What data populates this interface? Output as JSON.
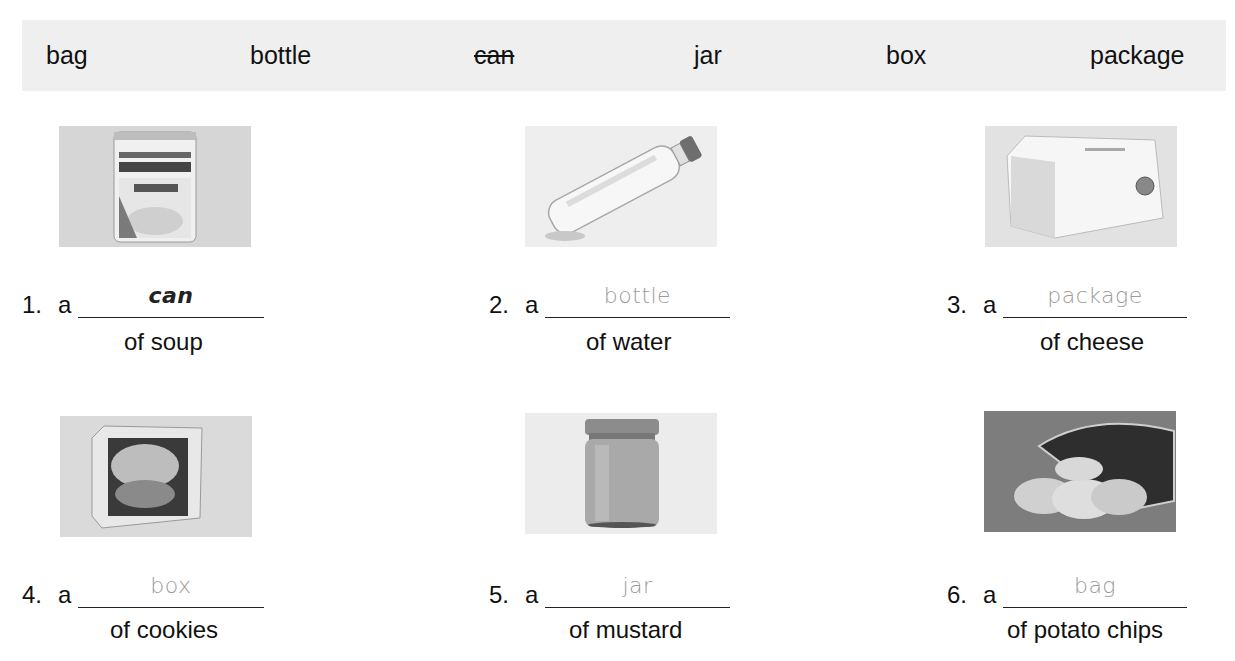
{
  "word_bank": {
    "words": [
      {
        "text": "bag",
        "struck": false
      },
      {
        "text": "bottle",
        "struck": false
      },
      {
        "text": "can",
        "struck": true
      },
      {
        "text": "jar",
        "struck": false
      },
      {
        "text": "box",
        "struck": false
      },
      {
        "text": "package",
        "struck": false
      }
    ],
    "background_color": "#efefef"
  },
  "items": [
    {
      "number": "1.",
      "article": "a",
      "answer": "can",
      "is_example": true,
      "phrase": "of soup",
      "image": "can-of-pea-soup-photo"
    },
    {
      "number": "2.",
      "article": "a",
      "answer": "bottle",
      "is_example": false,
      "phrase": "of water",
      "image": "water-bottle-photo"
    },
    {
      "number": "3.",
      "article": "a",
      "answer": "package",
      "is_example": false,
      "phrase": "of cheese",
      "image": "cheese-package-photo"
    },
    {
      "number": "4.",
      "article": "a",
      "answer": "box",
      "is_example": false,
      "phrase": "of cookies",
      "image": "cookie-box-photo"
    },
    {
      "number": "5.",
      "article": "a",
      "answer": "jar",
      "is_example": false,
      "phrase": "of mustard",
      "image": "mustard-jar-photo"
    },
    {
      "number": "6.",
      "article": "a",
      "answer": "bag",
      "is_example": false,
      "phrase": "of potato chips",
      "image": "potato-chip-bag-photo"
    }
  ],
  "colors": {
    "answer_text": "#9a9a9a",
    "example_text": "#222222",
    "photo_bg": "#dcdcdc"
  }
}
